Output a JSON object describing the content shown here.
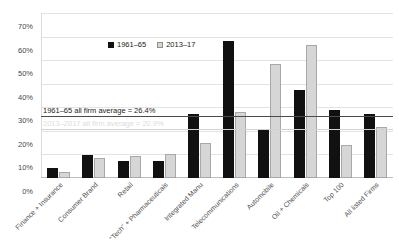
{
  "title_fragment": "",
  "legend": {
    "position": "inside-top-center",
    "items": [
      {
        "label": "1961–65",
        "color": "#111111"
      },
      {
        "label": "2013–17",
        "color": "#d6d6d6"
      }
    ]
  },
  "reference_lines": [
    {
      "label": "1961–65 all firm average = 26.4%",
      "value": 26.4,
      "color": "#4b4b4b"
    },
    {
      "label": "2013–2017 all firm average = 20.9%",
      "value": 20.9,
      "color": "#d2d2d2"
    }
  ],
  "chart_data": {
    "type": "bar",
    "title": "",
    "xlabel": "",
    "ylabel": "",
    "ylim": [
      0,
      70
    ],
    "ytick_labels": [
      "70%",
      "60%",
      "50%",
      "40%",
      "30%",
      "20%",
      "10%",
      "0%"
    ],
    "ytick_values": [
      70,
      60,
      50,
      40,
      30,
      20,
      10,
      0
    ],
    "grid": true,
    "legend_position": "inside top center",
    "categories": [
      "Finance + Insurance",
      "Consumer Brand",
      "Retail",
      "“Tech” + Pharmaceuticals",
      "Integrated Manu",
      "Telecommunications",
      "Automobile",
      "Oil + Chemicals",
      "Top 100",
      "All listed Firms"
    ],
    "series": [
      {
        "name": "1961–65",
        "color": "#111111",
        "values": [
          4.3,
          9.8,
          7.2,
          7.2,
          27.2,
          58.2,
          20.4,
          37.5,
          29.0,
          27.1
        ]
      },
      {
        "name": "2013–17",
        "color": "#d6d6d6",
        "values": [
          2.6,
          8.5,
          9.3,
          10.2,
          15.0,
          27.8,
          48.5,
          56.5,
          14.1,
          21.7
        ]
      }
    ],
    "annotations": [
      {
        "text": "1961–65 all firm average = 26.4%",
        "y": 26.4
      },
      {
        "text": "2013–2017 all firm average = 20.9%",
        "y": 20.9
      }
    ]
  }
}
